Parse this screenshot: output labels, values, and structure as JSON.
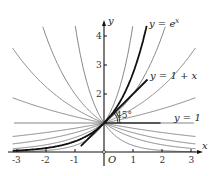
{
  "chart_data": {
    "type": "line",
    "title": "",
    "xlabel": "x",
    "ylabel": "y",
    "origin_label": "O",
    "xlim": [
      -3.2,
      3.3
    ],
    "ylim": [
      -0.3,
      4.4
    ],
    "x_ticks": [
      "-3",
      "-2",
      "-1",
      "1",
      "2",
      "3"
    ],
    "y_ticks": [
      "1",
      "2",
      "3",
      "4"
    ],
    "grid": false,
    "series": [
      {
        "name": "y = a^x, a = 1.22",
        "base": 1.22,
        "style": "thin-gray"
      },
      {
        "name": "y = a^x, a = 1.5",
        "base": 1.5,
        "style": "thin-gray"
      },
      {
        "name": "y = a^x, a = 2",
        "base": 2,
        "style": "thin-gray"
      },
      {
        "name": "y = a^x, a = 4.4",
        "base": 4.4,
        "style": "thin-gray"
      },
      {
        "name": "y = a^x, a = 1/1.22",
        "base": 0.82,
        "style": "thin-gray"
      },
      {
        "name": "y = a^x, a = 1/1.5",
        "base": 0.667,
        "style": "thin-gray"
      },
      {
        "name": "y = a^x, a = 1/2",
        "base": 0.5,
        "style": "thin-gray"
      },
      {
        "name": "y = a^x, a = 1/4.4",
        "base": 0.227,
        "style": "thin-gray"
      },
      {
        "name": "y = e^x",
        "base": 2.718,
        "style": "thick-black"
      },
      {
        "name": "y = 1 + x",
        "type": "tangent",
        "x_range": [
          -0.8,
          1.5
        ],
        "style": "thick-black"
      },
      {
        "name": "y = 1",
        "type": "horizontal",
        "style": "gray"
      }
    ],
    "annotations": [
      {
        "text": "y = e",
        "sup": "x",
        "near": [
          1.55,
          4.3
        ]
      },
      {
        "text": "y = 1 + x",
        "near": [
          1.55,
          2.5
        ]
      },
      {
        "text": "y = 1",
        "near": [
          2.5,
          1.1
        ]
      },
      {
        "text": "45°",
        "near": [
          0.45,
          1.25
        ]
      }
    ]
  },
  "labels": {
    "y_ex": "y = e",
    "y_ex_sup": "x",
    "y_1px": "y = 1 + x",
    "y_1": "y = 1",
    "angle": "45°",
    "x_axis": "x",
    "y_axis": "y",
    "origin": "O",
    "xt": [
      "-3",
      "-2",
      "-1",
      "1",
      "2",
      "3"
    ],
    "yt": [
      "1",
      "2",
      "3",
      "4"
    ]
  }
}
